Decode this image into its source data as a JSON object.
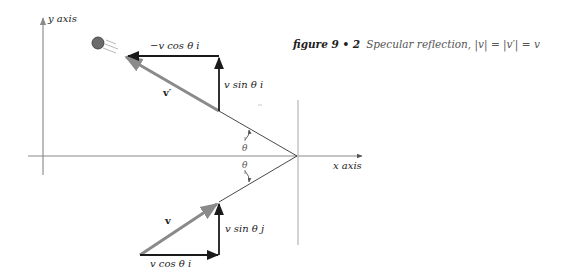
{
  "figure": {
    "number_label": "figure 9 • 2",
    "caption": "Specular reflection, |v| = |v′| = v"
  },
  "axes": {
    "y_label": "y axis",
    "x_label": "x axis"
  },
  "vectors": {
    "reflected_label": "v′",
    "incident_label": "v",
    "top_horizontal": "−v cos θ i",
    "top_vertical": "v sin θ i",
    "bottom_horizontal": "v cos θ i",
    "bottom_vertical": "v sin θ j"
  },
  "angles": {
    "upper": "θ",
    "lower": "θ"
  },
  "colors": {
    "axis": "#9a9a9a",
    "dark_arrow": "#1a1a1a",
    "gray_vector": "#8a8a8a",
    "ball": "#6b6b6b"
  }
}
